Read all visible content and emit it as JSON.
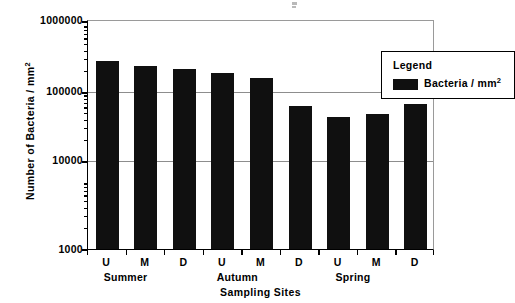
{
  "chart_data": {
    "type": "bar",
    "title": "",
    "xlabel": "Sampling Sites",
    "ylabel": "Number of Bacteria / mm2",
    "ylabel_base": "Number of Bacteria / mm",
    "ylabel_sup": "2",
    "yscale": "log",
    "ylim": [
      1000,
      1000000
    ],
    "ytick_labels": [
      "1000000",
      "100000",
      "10000",
      "1000"
    ],
    "ytick_values": [
      1000000,
      100000,
      10000,
      1000
    ],
    "grid": true,
    "grid_axis": "y",
    "legend_position": "upper right",
    "legend_title": "Legend",
    "series": [
      {
        "name": "Bacteria / mm2",
        "name_base": "Bacteria / mm",
        "name_sup": "2",
        "color": "#101010",
        "values": [
          280000,
          245000,
          225000,
          200000,
          172000,
          73000,
          52000,
          58000,
          78000
        ]
      }
    ],
    "categories": [
      "U",
      "M",
      "D",
      "U",
      "M",
      "D",
      "U",
      "M",
      "D"
    ],
    "groups": [
      {
        "label": "Summer",
        "categories": [
          "U",
          "M",
          "D"
        ]
      },
      {
        "label": "Autumn",
        "categories": [
          "U",
          "M",
          "D"
        ]
      },
      {
        "label": "Spring",
        "categories": [
          "U",
          "M",
          "D"
        ]
      }
    ]
  },
  "axes": {
    "y": {
      "ticks": [
        {
          "label": "1000000",
          "value": 1000000
        },
        {
          "label": "100000",
          "value": 100000
        },
        {
          "label": "10000",
          "value": 10000
        },
        {
          "label": "1000",
          "value": 1000
        }
      ],
      "title_base": "Number of Bacteria / mm",
      "title_sup": "2"
    },
    "x": {
      "title": "Sampling Sites",
      "tick_labels": [
        "U",
        "M",
        "D",
        "U",
        "M",
        "D",
        "U",
        "M",
        "D"
      ],
      "group_labels": [
        "Summer",
        "Autumn",
        "Spring"
      ]
    }
  },
  "legend": {
    "title": "Legend",
    "entries": [
      {
        "label_base": "Bacteria / mm",
        "label_sup": "2",
        "color": "#101010"
      }
    ]
  }
}
